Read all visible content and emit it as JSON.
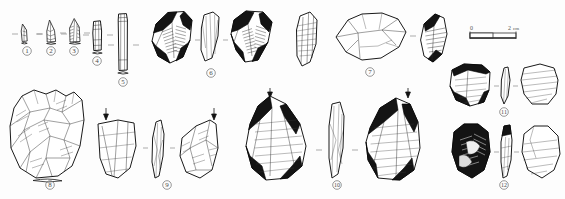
{
  "plate": {
    "title": "Lithic artifact illustration plate",
    "description": "Technical archaeological line drawings of twelve stone tools and cores, each shown in one to three views, numbered with encircled figures.",
    "background_color": "#fdfdfd",
    "ink_color": "#1a1a1a",
    "shading_color": "#141414",
    "label_color": "#4a4a4a"
  },
  "scale_bar": {
    "name": "scale-bar",
    "min_label": "0",
    "max_label": "2",
    "unit_label": "cm",
    "divisions": 2,
    "length_px": 46
  },
  "artifacts": [
    {
      "number": "1",
      "label": "①",
      "views": 1,
      "type": "microlithic point",
      "row": "top",
      "label_x": 27,
      "label_y": 51
    },
    {
      "number": "2",
      "label": "②",
      "views": 1,
      "type": "retouched point",
      "row": "top",
      "label_x": 51,
      "label_y": 51
    },
    {
      "number": "3",
      "label": "③",
      "views": 1,
      "type": "elongated point",
      "row": "top",
      "label_x": 74,
      "label_y": 51
    },
    {
      "number": "4",
      "label": "④",
      "views": 1,
      "type": "short blade segment",
      "row": "top",
      "label_x": 97,
      "label_y": 61
    },
    {
      "number": "5",
      "label": "⑤",
      "views": 1,
      "type": "long blade",
      "row": "top",
      "label_x": 123,
      "label_y": 82
    },
    {
      "number": "6",
      "label": "⑥",
      "views": 3,
      "type": "Levallois flake",
      "row": "top",
      "label_x": 211,
      "label_y": 73
    },
    {
      "number": "7",
      "label": "⑦",
      "views": 1,
      "type": "Levallois core",
      "row": "top",
      "label_x": 370,
      "label_y": 72
    },
    {
      "number": "8",
      "label": "⑧",
      "views": 1,
      "type": "large discoidal core",
      "row": "bottom",
      "label_x": 50,
      "label_y": 185
    },
    {
      "number": "9",
      "label": "⑨",
      "views": 3,
      "type": "side scraper",
      "row": "bottom",
      "label_x": 167,
      "label_y": 185
    },
    {
      "number": "10",
      "label": "⑩",
      "views": 3,
      "type": "large Levallois flake",
      "row": "bottom",
      "label_x": 337,
      "label_y": 185
    },
    {
      "number": "11",
      "label": "⑪",
      "views": 3,
      "type": "transverse scraper",
      "row": "right",
      "label_x": 504,
      "label_y": 112
    },
    {
      "number": "12",
      "label": "⑫",
      "views": 3,
      "type": "convergent scraper",
      "row": "right",
      "label_x": 504,
      "label_y": 185
    }
  ]
}
